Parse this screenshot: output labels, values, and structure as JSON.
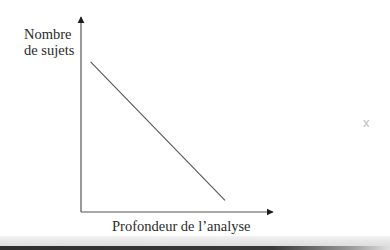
{
  "chart_data": {
    "type": "line",
    "title": "",
    "xlabel": "Profondeur de l’analyse",
    "ylabel": [
      "Nombre",
      "de sujets"
    ],
    "ylabel_full": "Nombre de sujets",
    "x_ticks": [],
    "y_ticks": [],
    "grid": false,
    "legend": null,
    "series": [
      {
        "name": "relation",
        "x": [
          0.05,
          0.75
        ],
        "y": [
          0.77,
          0.06
        ],
        "trend": "decreasing linear"
      }
    ],
    "xlim": [
      0,
      1
    ],
    "ylim": [
      0,
      1
    ],
    "annotations": [
      "x"
    ]
  },
  "labels": {
    "y_line1": "Nombre",
    "y_line2": "de sujets",
    "x": "Profondeur de l’analyse",
    "stray_mark": "x"
  }
}
